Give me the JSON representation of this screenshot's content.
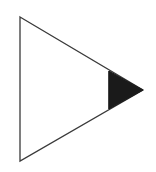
{
  "diagram": {
    "shape": "triangle",
    "orientation": "right-pointing",
    "vertices": {
      "top": [
        20,
        17
      ],
      "bottom": [
        20,
        161
      ],
      "apex": [
        143,
        90
      ]
    },
    "shaded_tip": {
      "x_start": 109,
      "top": [
        109,
        71
      ],
      "bottom": [
        109,
        109
      ],
      "apex": [
        143,
        90
      ]
    },
    "colors": {
      "fill": "#ffffff",
      "stroke": "#3a3a3a",
      "tip": "#1a1a1a"
    },
    "label": "Triangle with shaded tip"
  }
}
